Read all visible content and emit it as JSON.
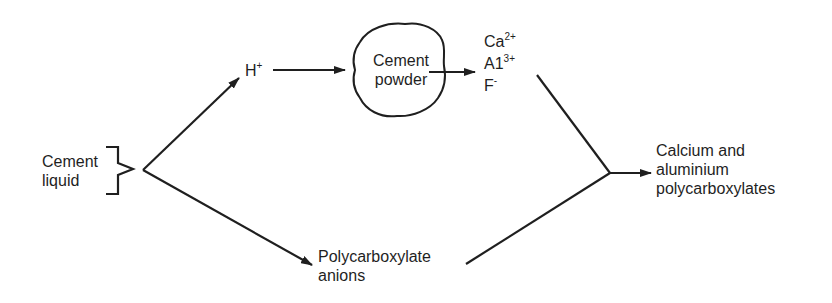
{
  "diagram": {
    "inputs": {
      "cement_liquid": [
        "Cement",
        "liquid"
      ]
    },
    "intermediates": {
      "proton": {
        "symbol": "H",
        "charge": "+"
      },
      "powder": [
        "Cement",
        "powder"
      ],
      "anions": [
        "Polycarboxylate",
        "anions"
      ]
    },
    "ions": [
      {
        "symbol": "Ca",
        "charge": "2+"
      },
      {
        "symbol": "A1",
        "charge": "3+"
      },
      {
        "symbol": "F",
        "charge": "-"
      }
    ],
    "product": [
      "Calcium and",
      "aluminium",
      "polycarboxylates"
    ],
    "colors": {
      "ink": "#1f1f1f",
      "background": "#ffffff"
    }
  }
}
